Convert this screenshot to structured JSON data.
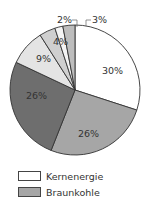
{
  "chart_data": {
    "type": "pie",
    "title": "",
    "slices": [
      {
        "label": "Kernenergie",
        "value": 30,
        "display": "30%",
        "color": "#ffffff"
      },
      {
        "label": "Braunkohle",
        "value": 26,
        "display": "26%",
        "color": "#a6a6a6"
      },
      {
        "label": "",
        "value": 26,
        "display": "26%",
        "color": "#6e6e6e"
      },
      {
        "label": "",
        "value": 9,
        "display": "9%",
        "color": "#e4e4e4"
      },
      {
        "label": "",
        "value": 4,
        "display": "4%",
        "color": "#cfcfcf"
      },
      {
        "label": "",
        "value": 2,
        "display": "2%",
        "color": "#f4f4f4"
      },
      {
        "label": "",
        "value": 3,
        "display": "3%",
        "color": "#bdbdbd"
      }
    ],
    "start_angle_deg": 0,
    "direction": "clockwise",
    "legend": {
      "position": "bottom-left",
      "entries": [
        "Kernenergie",
        "Braunkohle"
      ]
    }
  },
  "legend": {
    "items": [
      {
        "label": "Kernenergie",
        "color": "#ffffff"
      },
      {
        "label": "Braunkohle",
        "color": "#a6a6a6"
      }
    ]
  }
}
